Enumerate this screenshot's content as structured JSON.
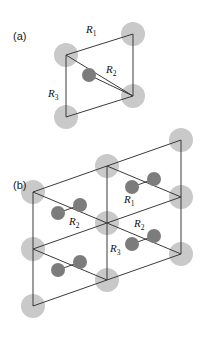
{
  "figure": {
    "kind": "crystal-lattice-diagram",
    "width": 203,
    "height": 338,
    "background": "#ffffff"
  },
  "colors": {
    "background": "#ffffff",
    "light_atom": "#c9c9c9",
    "dark_atom": "#7c7c7c",
    "bond_line": "#3a3a3a",
    "text": "#1a1a1a"
  },
  "panels": [
    {
      "id": "a",
      "tag": "(a)",
      "tag_x": 13,
      "tag_y": 40,
      "description": "single rhombohedral unit cell with one interior dark atom"
    },
    {
      "id": "b",
      "tag": "(b)",
      "tag_x": 13,
      "tag_y": 189,
      "description": "two by two array of unit cells showing repeated lattice"
    }
  ],
  "labels": {
    "panel_a": [
      {
        "name": "R1",
        "base": "R",
        "sub": "1",
        "x": 86,
        "y": 33
      },
      {
        "name": "R2",
        "base": "R",
        "sub": "2",
        "x": 106,
        "y": 73
      },
      {
        "name": "R3",
        "base": "R",
        "sub": "3",
        "x": 48,
        "y": 97
      }
    ],
    "panel_b": [
      {
        "name": "R1",
        "base": "R",
        "sub": "1",
        "x": 124,
        "y": 203
      },
      {
        "name": "R2-left",
        "base": "R",
        "sub": "2",
        "x": 69,
        "y": 225
      },
      {
        "name": "R2-right",
        "base": "R",
        "sub": "2",
        "x": 134,
        "y": 227
      },
      {
        "name": "R3",
        "base": "R",
        "sub": "3",
        "x": 110,
        "y": 252
      }
    ]
  },
  "panel_a_geometry": {
    "cell_vertices": [
      {
        "name": "top-left",
        "x": 66,
        "y": 55
      },
      {
        "name": "top-right",
        "x": 133,
        "y": 34
      },
      {
        "name": "bottom-right",
        "x": 133,
        "y": 96
      },
      {
        "name": "bottom-left",
        "x": 66,
        "y": 117
      }
    ],
    "diagonal": {
      "from": "top-left",
      "to": "bottom-right"
    },
    "light_atoms": [
      {
        "x": 66,
        "y": 55,
        "r": 12
      },
      {
        "x": 133,
        "y": 34,
        "r": 12
      },
      {
        "x": 133,
        "y": 96,
        "r": 12
      },
      {
        "x": 66,
        "y": 117,
        "r": 12
      }
    ],
    "dark_atoms": [
      {
        "x": 89,
        "y": 75,
        "r": 7
      }
    ],
    "bonds": [
      {
        "from": {
          "x": 89,
          "y": 75
        },
        "to": {
          "x": 133,
          "y": 96
        }
      }
    ]
  },
  "panel_b_geometry": {
    "origin": {
      "x": 33,
      "y": 192
    },
    "vector_a": {
      "dx": 74,
      "dy": -26
    },
    "vector_b": {
      "dx": 0,
      "dy": 57
    },
    "cols": 2,
    "rows": 2,
    "node_light_radius": 12,
    "dark_atom_radius": 7,
    "dark_atom_offset": {
      "dx": 25,
      "dy": 21
    },
    "dark_atom_pair_offset": {
      "dx": 22,
      "dy": -8
    }
  },
  "atom_legend": {
    "light_atom_label": "lattice site atom",
    "dark_atom_label": "basis atom"
  }
}
